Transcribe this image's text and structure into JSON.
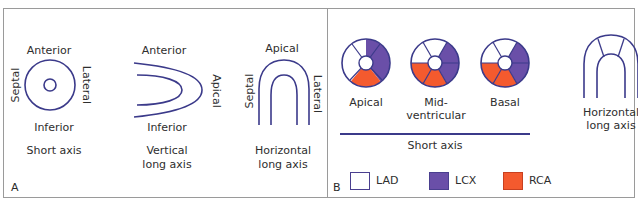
{
  "figure_number": "44",
  "colors": {
    "outline": "#3b3a8a",
    "LAD": "#ffffff",
    "LCX": "#6a4fa8",
    "RCA": "#f45a2e",
    "badge_bg": "#111111",
    "border": "#9a9a9a"
  },
  "panel_a": {
    "letter": "A",
    "short_axis": {
      "top": "Anterior",
      "bottom": "Inferior",
      "left": "Septal",
      "right": "Lateral",
      "caption": "Short axis"
    },
    "vertical_long_axis": {
      "top": "Anterior",
      "bottom": "Inferior",
      "right": "Apical",
      "caption_line1": "Vertical",
      "caption_line2": "long axis"
    },
    "horizontal_long_axis": {
      "top": "Apical",
      "left": "Septal",
      "right": "Lateral",
      "caption_line1": "Horizontal",
      "caption_line2": "long axis"
    }
  },
  "panel_b": {
    "letter": "B",
    "short_axis_views": [
      {
        "label": "Apical",
        "segments": {
          "top": "LAD",
          "right": "LCX",
          "bottom": "RCA",
          "left": "LAD"
        }
      },
      {
        "label_line1": "Mid-",
        "label_line2": "ventricular",
        "segments": {
          "ant": "LAD",
          "antlat": "LAD",
          "inflat": "LCX",
          "antlat2": "LCX",
          "inf": "RCA",
          "infsep": "RCA"
        }
      },
      {
        "label": "Basal",
        "segments": {
          "ant": "LAD",
          "antsep": "LAD",
          "antlat": "LCX",
          "inflat": "LCX",
          "inf": "RCA",
          "infsep": "RCA"
        }
      }
    ],
    "short_axis_caption": "Short axis",
    "horizontal_long_axis": {
      "caption_line1": "Horizontal",
      "caption_line2": "long axis"
    },
    "legend": [
      {
        "key": "LAD",
        "color": "#ffffff"
      },
      {
        "key": "LCX",
        "color": "#6a4fa8"
      },
      {
        "key": "RCA",
        "color": "#f45a2e"
      }
    ]
  }
}
